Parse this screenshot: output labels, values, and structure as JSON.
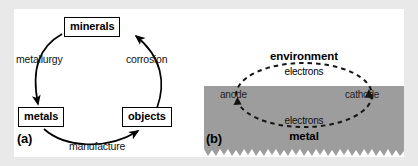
{
  "figure": {
    "background_color": "#e9e9e9",
    "panel_background": "#ffffff"
  },
  "panel_a": {
    "tag": "(a)",
    "type": "cycle-diagram",
    "nodes": [
      {
        "id": "minerals",
        "label": "minerals",
        "position": "top"
      },
      {
        "id": "metals",
        "label": "metals",
        "position": "bottom-left"
      },
      {
        "id": "objects",
        "label": "objects",
        "position": "bottom-right"
      }
    ],
    "edges": [
      {
        "from": "minerals",
        "to": "metals",
        "label": "metallurgy"
      },
      {
        "from": "metals",
        "to": "objects",
        "label": "manufacture"
      },
      {
        "from": "objects",
        "to": "minerals",
        "label": "corrosion"
      }
    ],
    "edge_labels": {
      "metallurgy": "metallurgy",
      "manufacture": "manufacture",
      "corrosion": "corrosion"
    },
    "stroke_color": "#000000"
  },
  "panel_b": {
    "tag": "(b)",
    "type": "corrosion-cell-schematic",
    "regions": {
      "upper": {
        "label": "environment",
        "color": "#ffffff"
      },
      "lower": {
        "label": "metal",
        "color": "#9d9d9d"
      }
    },
    "sites": {
      "anode": "anode",
      "cathode": "cathode"
    },
    "current_loop": {
      "top_label": "electrons",
      "bottom_label": "electrons",
      "style": "dashed-ellipse",
      "color": "#1a1a1a"
    }
  }
}
